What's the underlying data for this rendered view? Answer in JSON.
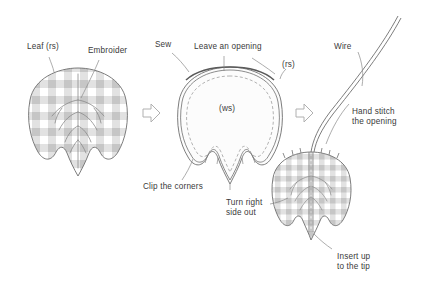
{
  "diagram": {
    "background_color": "#ffffff",
    "ink_color": "#3a3a3a",
    "line_color": "#6e6e6e",
    "gingham_color": "#cfcfcf",
    "arrow_color": "#b4b4b4",
    "steps": [
      {
        "id": "step-1",
        "name": "embroider-leaf",
        "labels": [
          "leaf_rs",
          "embroider"
        ]
      },
      {
        "id": "step-2",
        "name": "sew-leaf",
        "labels": [
          "sew",
          "leave_an_opening",
          "rs",
          "ws",
          "clip_the_corners"
        ]
      },
      {
        "id": "step-3",
        "name": "insert-wire",
        "labels": [
          "wire",
          "hand_stitch_the_opening",
          "turn_right_side_out",
          "insert_up_to_the_tip"
        ]
      }
    ]
  },
  "labels": {
    "leaf_rs": "Leaf (rs)",
    "embroider": "Embroider",
    "sew": "Sew",
    "leave_an_opening": "Leave an opening",
    "rs": "(rs)",
    "ws": "(ws)",
    "clip_the_corners": "Clip the corners",
    "turn_right_side_out_line1": "Turn right",
    "turn_right_side_out_line2": "side out",
    "wire": "Wire",
    "hand_stitch_line1": "Hand stitch",
    "hand_stitch_line2": "the opening",
    "insert_up_line1": "Insert up",
    "insert_up_line2": "to the tip"
  },
  "icons": {
    "arrow_1": "arrow-right-icon",
    "arrow_2": "arrow-right-icon"
  }
}
